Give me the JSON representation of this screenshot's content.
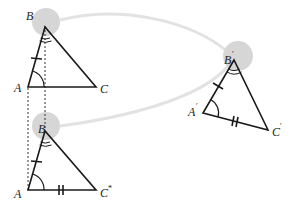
{
  "diagram": {
    "type": "geometry-congruence",
    "colors": {
      "stroke": "#1a1a1a",
      "highlight": "#d4d4d4",
      "connector": "#e0e0e0"
    },
    "triangle_top": {
      "label_B": "B",
      "label_A": "A",
      "label_C": "C"
    },
    "triangle_bottom": {
      "label_B": "B",
      "label_A": "A",
      "label_C": "C",
      "label_C_sup": "*"
    },
    "triangle_right": {
      "label_B": "B",
      "label_B_prime": "′",
      "label_A": "A",
      "label_A_prime": "′",
      "label_C": "C",
      "label_C_prime": "′"
    }
  }
}
